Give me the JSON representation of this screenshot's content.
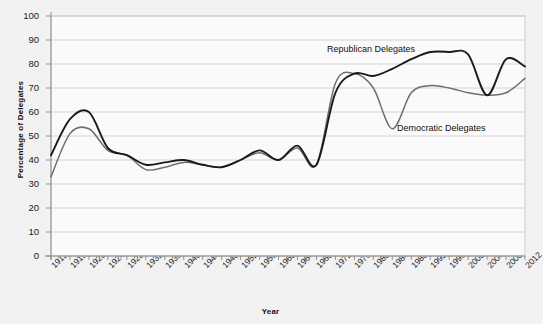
{
  "chart_data": {
    "type": "line",
    "title": "",
    "xlabel": "Year",
    "ylabel": "Percentage of Delegates",
    "ylim": [
      0,
      100
    ],
    "ytick_step": 10,
    "grid": true,
    "legend_position": "inline-annotation",
    "ytick_labels": [
      "100",
      "90",
      "80",
      "70",
      "60",
      "50",
      "40",
      "30",
      "20",
      "10",
      "0"
    ],
    "categories": [
      1912,
      1916,
      1920,
      1924,
      1928,
      1932,
      1936,
      1940,
      1944,
      1948,
      1952,
      1956,
      1960,
      1964,
      1968,
      1972,
      1976,
      1980,
      1984,
      1988,
      1992,
      1996,
      2000,
      2004,
      2008,
      2012
    ],
    "xtick_labels": [
      "1912",
      "1916",
      "1920",
      "1924",
      "1928",
      "1932",
      "1936",
      "1940",
      "1944",
      "1948",
      "1952",
      "1956",
      "1960",
      "1964",
      "1968",
      "1972",
      "1976",
      "1980",
      "1984",
      "1988",
      "1992",
      "1996",
      "2000",
      "2004",
      "2008",
      "2012"
    ],
    "series": [
      {
        "name": "Republican Delegates",
        "color": "#1a1a1a",
        "label_text": "Republican Delegates",
        "values": [
          42,
          57,
          60,
          45,
          42,
          38,
          39,
          40,
          38,
          37,
          40,
          44,
          40,
          46,
          38,
          68,
          76,
          75,
          78,
          82,
          85,
          85,
          84,
          67,
          82,
          79
        ]
      },
      {
        "name": "Democratic Delegates",
        "color": "#6e6e6e",
        "label_text": "Democratic Delegates",
        "values": [
          33,
          51,
          53,
          44,
          42,
          36,
          37,
          39,
          38,
          37,
          40,
          43,
          40,
          45,
          38,
          72,
          76,
          70,
          53,
          68,
          71,
          70,
          68,
          67,
          68,
          74
        ]
      }
    ]
  },
  "colors": {
    "background": "#f2f2f2",
    "plot_background": "#fafafa",
    "gridline": "#c9c9c9",
    "axis": "#8a8a8a",
    "republican": "#1a1a1a",
    "democratic": "#6e6e6e"
  }
}
